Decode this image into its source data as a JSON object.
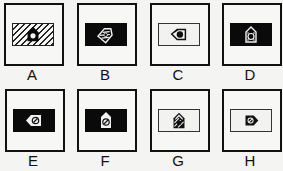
{
  "figure": {
    "panels": [
      {
        "label": "A",
        "inner_fill": "hatched",
        "icon": "pentagon-up-black-with-white-dot",
        "icon_orientation": "up"
      },
      {
        "label": "B",
        "inner_fill": "black",
        "icon": "pentagon-tilted-white-hatched",
        "icon_orientation": "tilted-right"
      },
      {
        "label": "C",
        "inner_fill": "white",
        "icon": "pentagon-left-outline-black-dot",
        "icon_orientation": "left"
      },
      {
        "label": "D",
        "inner_fill": "black",
        "icon": "pentagon-up-white-dotted",
        "icon_orientation": "up"
      },
      {
        "label": "E",
        "inner_fill": "black",
        "icon": "pentagon-left-white-slashed-circle",
        "icon_orientation": "left"
      },
      {
        "label": "F",
        "inner_fill": "black",
        "icon": "pentagon-up-white-slashed-circle",
        "icon_orientation": "up"
      },
      {
        "label": "G",
        "inner_fill": "white",
        "icon": "pentagon-up-black-hatched",
        "icon_orientation": "up"
      },
      {
        "label": "H",
        "inner_fill": "white",
        "icon": "pentagon-right-black-slashed-circle",
        "icon_orientation": "right"
      }
    ]
  },
  "colors": {
    "background": "#f4f4f2",
    "stroke": "#111111",
    "fill_dark": "#0a0a0a"
  }
}
